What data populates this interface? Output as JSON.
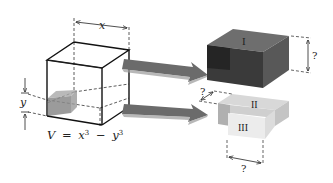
{
  "diagram": {
    "type": "geometric-decomposition",
    "main_cube": {
      "side_label": "x",
      "inner_cube_label": "y",
      "formula": "V = x³ − y³",
      "formula_parts": {
        "v": "V",
        "eq": "=",
        "x": "x",
        "exp1": "3",
        "minus": "−",
        "y": "y",
        "exp2": "3"
      }
    },
    "arrows": [
      {
        "from": "main-cube",
        "to": "piece-I"
      },
      {
        "from": "main-cube",
        "to": "pieces-II-III"
      }
    ],
    "pieces": [
      {
        "label": "I",
        "dimension_label": "?",
        "color": "#4a4a4a"
      },
      {
        "label": "II",
        "dimension_label": "?",
        "color": "#c8c8c8"
      },
      {
        "label": "III",
        "dimension_label": "?",
        "color": "#e6e6e6"
      }
    ],
    "colors": {
      "line": "#111111",
      "dashed": "#333333",
      "arrow": "#6b6b6b",
      "inner_cube": "#8a8a8a",
      "piece_I_front": "#3a3a3a",
      "piece_I_top": "#6a6a6a",
      "piece_I_side": "#555555",
      "piece_II": "#cfcfcf",
      "piece_III": "#e9e9e9"
    }
  }
}
